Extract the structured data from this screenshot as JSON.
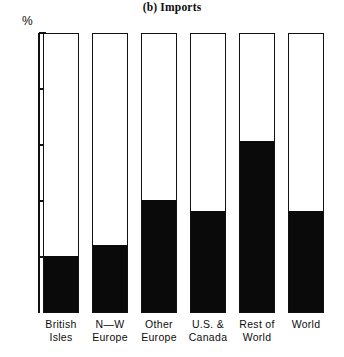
{
  "chart_data": {
    "type": "bar",
    "title": "(b) Imports",
    "subtitle": "",
    "xlabel": "",
    "ylabel": "%",
    "ylim": [
      0,
      100
    ],
    "yticks": [
      20,
      40,
      60,
      80,
      100
    ],
    "ytick_labels": [
      "20",
      "40",
      "60",
      "80",
      "100"
    ],
    "grid": false,
    "legend": "none",
    "stacked": true,
    "categories": [
      "British Isles",
      "N—W Europe",
      "Other Europe",
      "U.S. & Canada",
      "Rest of World",
      "World"
    ],
    "category_lines": [
      [
        "British",
        "Isles"
      ],
      [
        "N—W",
        "Europe"
      ],
      [
        "Other",
        "Europe"
      ],
      [
        "U.S. &",
        "Canada"
      ],
      [
        "Rest of",
        "World"
      ],
      [
        "World",
        ""
      ]
    ],
    "series": [
      {
        "name": "filled",
        "color": "#0a0a0a",
        "values": [
          20,
          24,
          40,
          36,
          61,
          36
        ]
      },
      {
        "name": "remainder",
        "color": "#ffffff",
        "values": [
          80,
          76,
          60,
          64,
          39,
          64
        ]
      }
    ]
  }
}
